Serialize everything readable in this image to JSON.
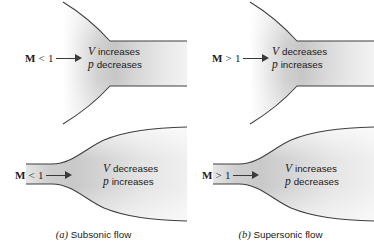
{
  "figure": {
    "background_color": "#ffffff",
    "duct_fill_light": "#fbfbfb",
    "duct_fill_mid": "#d2d2d2",
    "duct_fill_dark": "#a8a8a8",
    "duct_edge_color": "#3f3f3f",
    "text_color": "#1a1a1a"
  },
  "panels": [
    {
      "id": "top-left",
      "duct_type": "converging-nozzle",
      "mach": {
        "symbol": "M",
        "relation": "< 1",
        "arrow": "right-arrow-icon"
      },
      "annotation": {
        "line1_symbol": "V",
        "line1_word": "increases",
        "line2_symbol": "p",
        "line2_word": "decreases"
      }
    },
    {
      "id": "top-right",
      "duct_type": "converging-nozzle",
      "mach": {
        "symbol": "M",
        "relation": "> 1",
        "arrow": "right-arrow-icon"
      },
      "annotation": {
        "line1_symbol": "V",
        "line1_word": "decreases",
        "line2_symbol": "p",
        "line2_word": "increases"
      }
    },
    {
      "id": "bottom-left",
      "duct_type": "diverging-duct",
      "mach": {
        "symbol": "M",
        "relation": "< 1",
        "arrow": "right-arrow-icon"
      },
      "annotation": {
        "line1_symbol": "V",
        "line1_word": "decreases",
        "line2_symbol": "p",
        "line2_word": "increases"
      }
    },
    {
      "id": "bottom-right",
      "duct_type": "diverging-duct",
      "mach": {
        "symbol": "M",
        "relation": "> 1",
        "arrow": "right-arrow-icon"
      },
      "annotation": {
        "line1_symbol": "V",
        "line1_word": "increases",
        "line2_symbol": "p",
        "line2_word": "decreases"
      }
    }
  ],
  "captions": [
    {
      "tag": "(a)",
      "label": "Subsonic flow"
    },
    {
      "tag": "(b)",
      "label": "Supersonic flow"
    }
  ]
}
